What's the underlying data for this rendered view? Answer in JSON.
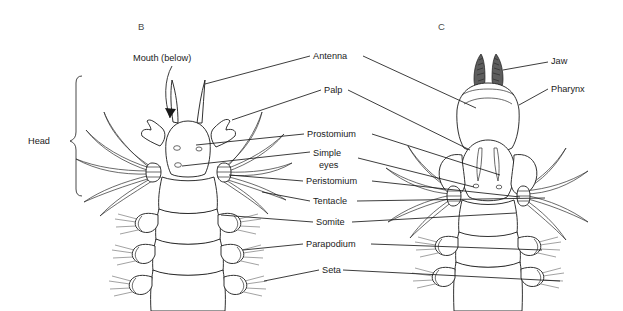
{
  "figure": {
    "background_color": "#ffffff",
    "ink_color": "#1a1a1a",
    "panels": [
      {
        "id": "B",
        "label": "B",
        "x": 138,
        "y": 30,
        "description": "dorsal view of anterior end with head appendages"
      },
      {
        "id": "C",
        "label": "C",
        "x": 438,
        "y": 30,
        "description": "anterior end with pharynx everted showing jaws"
      }
    ],
    "bracket": {
      "label": "Head",
      "label_x": 48,
      "label_y": 141,
      "span_top": 76,
      "span_bottom": 196
    },
    "center_labels": [
      {
        "name": "antenna",
        "text": "Antenna",
        "x": 313,
        "y": 59,
        "lines": 1
      },
      {
        "name": "palp",
        "text": "Palp",
        "x": 324,
        "y": 93,
        "lines": 1
      },
      {
        "name": "prostomium",
        "text": "Prostomium",
        "x": 307,
        "y": 137,
        "lines": 1
      },
      {
        "name": "simple-eyes",
        "text": "Simple",
        "text2": "eyes",
        "x": 313,
        "y": 156,
        "lines": 2
      },
      {
        "name": "peristomium",
        "text": "Peristomium",
        "x": 306,
        "y": 184,
        "lines": 1
      },
      {
        "name": "tentacle",
        "text": "Tentacle",
        "x": 313,
        "y": 204,
        "lines": 1
      },
      {
        "name": "somite",
        "text": "Somite",
        "x": 316,
        "y": 225,
        "lines": 1
      },
      {
        "name": "parapodium",
        "text": "Parapodium",
        "x": 306,
        "y": 247,
        "lines": 1
      },
      {
        "name": "seta",
        "text": "Seta",
        "x": 322,
        "y": 273,
        "lines": 1
      }
    ],
    "right_labels": [
      {
        "name": "jaw",
        "text": "Jaw",
        "x": 551,
        "y": 64
      },
      {
        "name": "pharynx",
        "text": "Pharynx",
        "x": 551,
        "y": 92
      }
    ],
    "callouts": [
      {
        "name": "mouth-below",
        "text": "Mouth (below)",
        "x": 133,
        "y": 61,
        "arrow": "curved arrow pointing down-right to mouth"
      }
    ]
  }
}
